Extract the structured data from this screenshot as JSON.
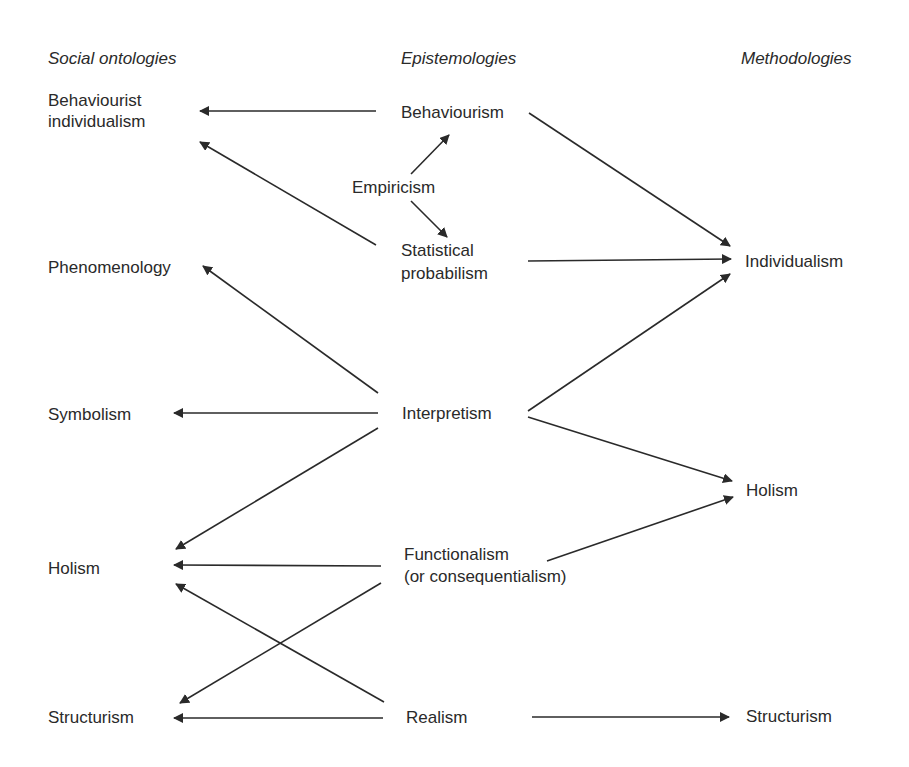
{
  "headers": {
    "social_ontologies": "Social ontologies",
    "epistemologies": "Epistemologies",
    "methodologies": "Methodologies"
  },
  "nodes": {
    "behaviourist_individualism": [
      "Behaviourist",
      "individualism"
    ],
    "phenomenology": [
      "Phenomenology"
    ],
    "symbolism": [
      "Symbolism"
    ],
    "holism_ont": [
      "Holism"
    ],
    "structurism_ont": [
      "Structurism"
    ],
    "behaviourism": [
      "Behaviourism"
    ],
    "empiricism": [
      "Empiricism"
    ],
    "statistical_probabilism": [
      "Statistical",
      "probabilism"
    ],
    "interpretism": [
      "Interpretism"
    ],
    "functionalism": [
      "Functionalism",
      "(or consequentialism)"
    ],
    "realism": [
      "Realism"
    ],
    "individualism_meth": [
      "Individualism"
    ],
    "holism_meth": [
      "Holism"
    ],
    "structurism_meth": [
      "Structurism"
    ]
  },
  "edges": [
    {
      "from": "behaviourism",
      "to": "behaviourist_individualism"
    },
    {
      "from": "statistical_probabilism",
      "to": "behaviourist_individualism"
    },
    {
      "from": "empiricism",
      "to": "behaviourism"
    },
    {
      "from": "empiricism",
      "to": "statistical_probabilism"
    },
    {
      "from": "behaviourism",
      "to": "individualism_meth"
    },
    {
      "from": "statistical_probabilism",
      "to": "individualism_meth"
    },
    {
      "from": "interpretism",
      "to": "phenomenology"
    },
    {
      "from": "interpretism",
      "to": "symbolism"
    },
    {
      "from": "interpretism",
      "to": "holism_ont"
    },
    {
      "from": "interpretism",
      "to": "individualism_meth"
    },
    {
      "from": "interpretism",
      "to": "holism_meth"
    },
    {
      "from": "functionalism",
      "to": "holism_ont"
    },
    {
      "from": "functionalism",
      "to": "structurism_ont"
    },
    {
      "from": "functionalism",
      "to": "holism_meth"
    },
    {
      "from": "realism",
      "to": "holism_ont"
    },
    {
      "from": "realism",
      "to": "structurism_ont"
    },
    {
      "from": "realism",
      "to": "structurism_meth"
    }
  ]
}
